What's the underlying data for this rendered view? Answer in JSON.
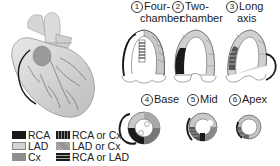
{
  "colors": {
    "RCA": "#1a1a1a",
    "LAD": "#d4d4d4",
    "Cx": "#8e8e8e",
    "RCA_or_Cx": "#555555",
    "LAD_or_Cx": "#b0b0b0",
    "RCA_or_LAD": "#444444"
  },
  "views": [
    {
      "number": "①",
      "line1": "Four-",
      "line2": "chamber"
    },
    {
      "number": "②",
      "line1": "Two-",
      "line2": "chamber"
    },
    {
      "number": "③",
      "line1": "Long",
      "line2": "axis"
    },
    {
      "number": "④",
      "line1": "Base",
      "line2": ""
    },
    {
      "number": "⑤",
      "line1": "Mid",
      "line2": ""
    },
    {
      "number": "⑥",
      "line1": "Apex",
      "line2": ""
    }
  ],
  "legend": [
    {
      "label": "RCA",
      "pattern": "solid-black"
    },
    {
      "label": "LAD",
      "pattern": "light-gray"
    },
    {
      "label": "Cx",
      "pattern": "mid-gray"
    },
    {
      "label": "RCA or Cx",
      "pattern": "vertical-stripes"
    },
    {
      "label": "LAD or Cx",
      "pattern": "dotted"
    },
    {
      "label": "RCA or LAD",
      "pattern": "horizontal-stripes"
    }
  ]
}
